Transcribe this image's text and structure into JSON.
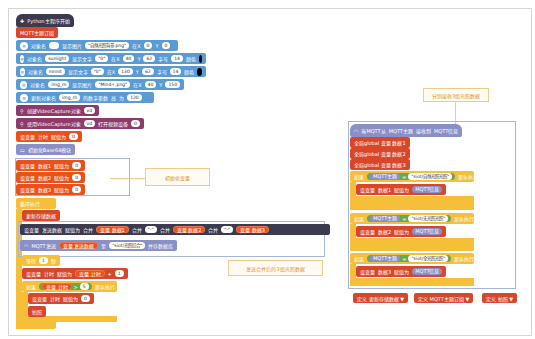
{
  "main_script": {
    "hat": "Python主程序开始",
    "mqtt_connect": "MQTT主题订阅",
    "display_blocks": [
      {
        "prefix": "对象名",
        "name": "",
        "action": "显示图片",
        "value": "\"自然光照背景.png\"",
        "x_label": "在X",
        "x": "0",
        "y_label": "Y",
        "y": "0"
      },
      {
        "prefix": "对象名",
        "name": "sunlight",
        "action": "显示文字",
        "value": "\"0\"",
        "x_label": "在X",
        "x": "40",
        "y_label": "Y",
        "y": "62",
        "size_label": "字号",
        "size": "14",
        "color_label": "颜色"
      },
      {
        "prefix": "对象名",
        "name": "mnnit",
        "action": "显示文字",
        "value": "\"0\"",
        "x_label": "在X",
        "x": "130",
        "y_label": "Y",
        "y": "62",
        "size_label": "字号",
        "size": "14",
        "color_label": "颜色"
      },
      {
        "prefix": "对象名",
        "name": "img_m",
        "action": "显示图片",
        "value": "\"Mind+.png\"",
        "x_label": "在X",
        "x": "40",
        "y_label": "Y",
        "y": "150"
      }
    ],
    "update_param": {
      "label": "更新对象名",
      "name": "img_m",
      "mid": "的数字参数",
      "param": "高",
      "to": "为",
      "value": "120"
    },
    "video_create": {
      "label": "创建VideoCapture对象",
      "obj": "vd"
    },
    "video_open": {
      "label": "使用VideoCapture对象",
      "obj": "vd",
      "mid": "打开视频设备",
      "value": "0"
    },
    "set_timer": {
      "label": "设变量",
      "var": "计时",
      "to": "赋值为",
      "value": "0"
    },
    "init_base64": "初始化Base64模块",
    "init_vars": [
      {
        "label": "设变量",
        "var": "数据1",
        "to": "赋值为",
        "value": "0"
      },
      {
        "label": "设变量",
        "var": "数据2",
        "to": "赋值为",
        "value": "0"
      },
      {
        "label": "设变量",
        "var": "数据3",
        "to": "赋值为",
        "value": "0"
      }
    ],
    "loop": "循环执行",
    "update_func": "更新存储数据",
    "set_send": {
      "label": "设变量",
      "var": "发送数据",
      "to": "赋值为",
      "join": "合并",
      "v1": "变量 数据1",
      "sep1": "\"-\"",
      "v2": "变量 数据2",
      "sep2": "\"-\"",
      "v3": "变量 数据3"
    },
    "mqtt_send": {
      "label": "MQTT发送",
      "var": "变量 发送数据",
      "to": "至",
      "topic": "\"siot/光照综合\"",
      "suffix": "并存数据库"
    },
    "wait": {
      "label": "等待",
      "value": "1",
      "unit": "秒"
    },
    "timer_inc": {
      "label": "设变量",
      "var": "计时",
      "to": "赋值为",
      "expr": "变量 计时",
      "op": "+",
      "value": "1"
    },
    "if_block": {
      "label": "如果",
      "var": "变量 计时",
      "op": ">",
      "value": "5",
      "then": "那么执行"
    },
    "reset_timer": {
      "label": "设变量",
      "var": "计时",
      "to": "赋值为",
      "value": "0"
    },
    "call": "拍照"
  },
  "mqtt_handler": {
    "hat": {
      "label": "当MQTT从",
      "topic": "MQTT主题",
      "mid": "接收到",
      "msg": "MQTT信息"
    },
    "globals": [
      "全局global 变量 数据1",
      "全局global 变量 数据2",
      "全局global 变量 数据3"
    ],
    "conditions": [
      {
        "if": "如果",
        "topic": "MQTT主题",
        "op": "=",
        "value": "\"siot/自然光照光照\"",
        "then": "那么执行",
        "set": "设变量",
        "var": "数据1",
        "to": "赋值为",
        "msg": "MQTT信息"
      },
      {
        "if": "如果",
        "topic": "MQTT主题",
        "op": "=",
        "value": "\"siot/无光照光照\"",
        "then": "那么执行",
        "set": "设变量",
        "var": "数据2",
        "to": "赋值为",
        "msg": "MQTT信息"
      },
      {
        "if": "如果",
        "topic": "MQTT主题",
        "op": "=",
        "value": "\"siot/全光照光照\"",
        "then": "那么执行",
        "set": "设变量",
        "var": "数据3",
        "to": "赋值为",
        "msg": "MQTT信息"
      }
    ]
  },
  "func_defs": [
    "定义 更新存储数据 ▼",
    "定义 MQTT主题订阅 ▼",
    "定义 拍照 ▼"
  ],
  "notes": {
    "init": "初始化变量",
    "send": "发送合并后的3组光照数据",
    "receive": "分别接收3组光照数据"
  }
}
